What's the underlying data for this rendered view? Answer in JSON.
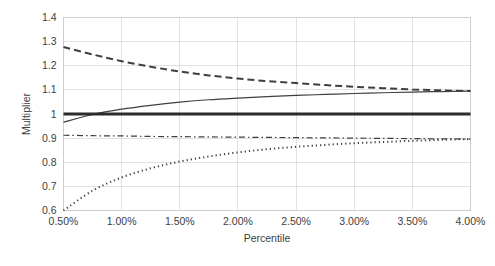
{
  "chart_data": {
    "type": "line",
    "title": "",
    "xlabel": "Percentile",
    "ylabel": "Multiplier",
    "xlim": [
      0.5,
      4.0
    ],
    "ylim": [
      0.6,
      1.4
    ],
    "grid": true,
    "legend": "none",
    "x_tick_labels": [
      "0.50%",
      "1.00%",
      "1.50%",
      "2.00%",
      "2.50%",
      "3.00%",
      "3.50%",
      "4.00%"
    ],
    "x_ticks": [
      0.5,
      1.0,
      1.5,
      2.0,
      2.5,
      3.0,
      3.5,
      4.0
    ],
    "y_tick_labels": [
      "0.6",
      "0.7",
      "0.8",
      "0.9",
      "1",
      "1.1",
      "1.2",
      "1.3",
      "1.4"
    ],
    "y_ticks": [
      0.6,
      0.7,
      0.8,
      0.9,
      1.0,
      1.1,
      1.2,
      1.3,
      1.4
    ],
    "x": [
      0.5,
      0.75,
      1.0,
      1.25,
      1.5,
      1.75,
      2.0,
      2.25,
      2.5,
      2.75,
      3.0,
      3.25,
      3.5,
      3.75,
      4.0
    ],
    "series": [
      {
        "name": "upper-bound-dashed",
        "style": "dashed",
        "color": "#3f3f3f",
        "width": 2.0,
        "dasharray": "7,4",
        "values": [
          1.278,
          1.247,
          1.219,
          1.196,
          1.176,
          1.16,
          1.147,
          1.136,
          1.128,
          1.12,
          1.113,
          1.107,
          1.102,
          1.098,
          1.095
        ]
      },
      {
        "name": "fitted-curve-solid-thin",
        "style": "solid",
        "color": "#3f3f3f",
        "width": 1.2,
        "dasharray": "",
        "values": [
          0.966,
          0.998,
          1.02,
          1.036,
          1.049,
          1.059,
          1.066,
          1.072,
          1.077,
          1.081,
          1.085,
          1.088,
          1.091,
          1.093,
          1.095
        ]
      },
      {
        "name": "baseline-solid-thick",
        "style": "solid",
        "color": "#2b2b2b",
        "width": 3.0,
        "dasharray": "",
        "values": [
          1.0,
          1.0,
          1.0,
          1.0,
          1.0,
          1.0,
          1.0,
          1.0,
          1.0,
          1.0,
          1.0,
          1.0,
          1.0,
          1.0,
          1.0
        ]
      },
      {
        "name": "lower-reference-dash-dot",
        "style": "dash-dot",
        "color": "#3f3f3f",
        "width": 1.2,
        "dasharray": "6,3,1.5,3",
        "values": [
          0.912,
          0.91,
          0.909,
          0.907,
          0.906,
          0.905,
          0.904,
          0.903,
          0.902,
          0.901,
          0.9,
          0.899,
          0.898,
          0.897,
          0.896
        ]
      },
      {
        "name": "lower-bound-dotted",
        "style": "dotted",
        "color": "#3f3f3f",
        "width": 2.0,
        "dasharray": "1.2,3",
        "values": [
          0.6,
          0.682,
          0.737,
          0.775,
          0.803,
          0.824,
          0.841,
          0.854,
          0.864,
          0.872,
          0.879,
          0.884,
          0.889,
          0.893,
          0.896
        ]
      }
    ]
  }
}
